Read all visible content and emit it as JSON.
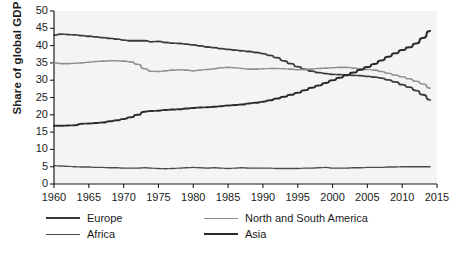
{
  "chart_data": {
    "type": "line",
    "title": "",
    "xlabel": "",
    "ylabel": "Share of global GDP",
    "xlim": [
      1960,
      2015
    ],
    "ylim": [
      0,
      50
    ],
    "grid": false,
    "legend_position": "bottom",
    "xticks": [
      1960,
      1965,
      1970,
      1975,
      1980,
      1985,
      1990,
      1995,
      2000,
      2005,
      2010,
      2015
    ],
    "yticks": [
      0,
      5,
      10,
      15,
      20,
      25,
      30,
      35,
      40,
      45,
      50
    ],
    "x": [
      1960,
      1961,
      1962,
      1963,
      1964,
      1965,
      1966,
      1967,
      1968,
      1969,
      1970,
      1971,
      1972,
      1973,
      1974,
      1975,
      1976,
      1977,
      1978,
      1979,
      1980,
      1981,
      1982,
      1983,
      1984,
      1985,
      1986,
      1987,
      1988,
      1989,
      1990,
      1991,
      1992,
      1993,
      1994,
      1995,
      1996,
      1997,
      1998,
      1999,
      2000,
      2001,
      2002,
      2003,
      2004,
      2005,
      2006,
      2007,
      2008,
      2009,
      2010,
      2011,
      2012,
      2013,
      2014
    ],
    "series": [
      {
        "name": "Europe",
        "color": "#3a3a3a",
        "width": 1.8,
        "values": [
          43.0,
          43.3,
          43.2,
          43.1,
          42.9,
          42.7,
          42.5,
          42.3,
          42.1,
          41.9,
          41.6,
          41.4,
          41.4,
          41.4,
          41.1,
          41.2,
          40.9,
          40.7,
          40.6,
          40.4,
          40.2,
          39.9,
          39.6,
          39.4,
          39.1,
          38.9,
          38.7,
          38.5,
          38.3,
          38.0,
          37.7,
          37.2,
          36.5,
          35.6,
          34.8,
          33.9,
          33.2,
          32.6,
          32.2,
          31.9,
          31.7,
          31.6,
          31.5,
          31.4,
          31.3,
          31.1,
          30.9,
          30.6,
          30.1,
          29.5,
          28.7,
          28.0,
          27.0,
          25.8,
          24.3
        ]
      },
      {
        "name": "Africa",
        "color": "#4a4a4a",
        "width": 1.4,
        "values": [
          5.3,
          5.2,
          5.1,
          5.0,
          4.9,
          4.9,
          4.8,
          4.8,
          4.7,
          4.7,
          4.6,
          4.6,
          4.6,
          4.7,
          4.6,
          4.5,
          4.4,
          4.5,
          4.6,
          4.7,
          4.8,
          4.7,
          4.6,
          4.7,
          4.6,
          4.5,
          4.6,
          4.7,
          4.6,
          4.6,
          4.6,
          4.6,
          4.5,
          4.5,
          4.5,
          4.5,
          4.6,
          4.6,
          4.7,
          4.8,
          4.6,
          4.6,
          4.6,
          4.7,
          4.7,
          4.8,
          4.8,
          4.8,
          4.9,
          4.9,
          5.0,
          5.0,
          5.0,
          5.0,
          5.0
        ]
      },
      {
        "name": "North and South America",
        "color": "#8f8f8f",
        "width": 1.6,
        "values": [
          35.0,
          34.8,
          34.8,
          34.9,
          35.0,
          35.2,
          35.4,
          35.5,
          35.6,
          35.6,
          35.5,
          35.3,
          34.6,
          33.3,
          32.6,
          32.5,
          32.7,
          32.9,
          33.0,
          32.9,
          32.7,
          32.9,
          33.1,
          33.3,
          33.6,
          33.7,
          33.6,
          33.4,
          33.2,
          33.2,
          33.3,
          33.4,
          33.4,
          33.3,
          33.2,
          33.0,
          33.0,
          33.2,
          33.4,
          33.5,
          33.6,
          33.7,
          33.7,
          33.5,
          33.3,
          33.1,
          32.9,
          32.5,
          32.0,
          31.5,
          31.0,
          30.4,
          29.7,
          28.9,
          27.7
        ]
      },
      {
        "name": "Asia",
        "color": "#2a2a2a",
        "width": 2.0,
        "values": [
          16.8,
          16.8,
          16.9,
          17.0,
          17.4,
          17.5,
          17.6,
          17.8,
          18.1,
          18.4,
          18.8,
          19.3,
          20.0,
          20.9,
          21.1,
          21.2,
          21.4,
          21.5,
          21.6,
          21.8,
          22.0,
          22.1,
          22.2,
          22.3,
          22.5,
          22.7,
          22.8,
          23.0,
          23.3,
          23.5,
          23.8,
          24.2,
          24.7,
          25.2,
          25.8,
          26.4,
          27.1,
          27.8,
          28.5,
          29.2,
          30.0,
          30.7,
          31.4,
          32.2,
          33.0,
          33.8,
          34.7,
          35.7,
          36.8,
          37.8,
          38.7,
          39.5,
          40.6,
          42.2,
          44.2
        ]
      }
    ]
  },
  "axis": {
    "ylabel": "Share of global GDP",
    "ytick_labels": [
      "50",
      "45",
      "40",
      "35",
      "30",
      "25",
      "20",
      "15",
      "10",
      "5",
      "0"
    ],
    "xtick_labels": [
      "1960",
      "1965",
      "1970",
      "1975",
      "1980",
      "1985",
      "1990",
      "1995",
      "2000",
      "2005",
      "2010",
      "2015"
    ]
  },
  "legend": {
    "items": [
      {
        "label": "Europe",
        "color": "#3a3a3a",
        "width": "2px"
      },
      {
        "label": "North and South America",
        "color": "#8f8f8f",
        "width": "1.6px"
      },
      {
        "label": "Africa",
        "color": "#4a4a4a",
        "width": "1.6px"
      },
      {
        "label": "Asia",
        "color": "#2a2a2a",
        "width": "2.2px"
      }
    ]
  },
  "style": {
    "plot_background": "#f4f4f4",
    "axis_color": "#1b1b1b",
    "page_background": "#ffffff"
  }
}
